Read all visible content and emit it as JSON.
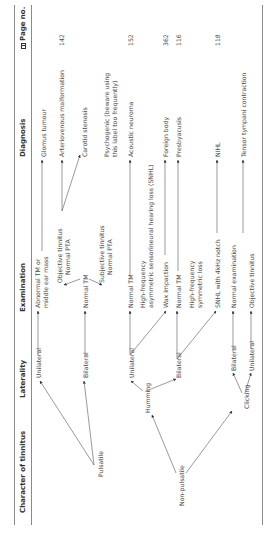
{
  "headers": {
    "character": "Character of tinnitus",
    "laterality": "Laterality",
    "examination": "Examination",
    "diagnosis": "Diagnosis",
    "page_no": "Page no.",
    "page_icon": "book-icon"
  },
  "character": {
    "pulsatile": "Pulsatile",
    "non_pulsatile": "Non-pulsatile",
    "humming": "Humming",
    "clicking": "Clicking"
  },
  "laterality": {
    "pulsatile_unilateral": "Unilateral",
    "pulsatile_bilateral": "Bilateral",
    "humming_unilateral": "Unilateral",
    "humming_bilateral": "Bilateral",
    "clicking_bilateral": "Bilateral",
    "clicking_unilateral": "Unilateral"
  },
  "examination": {
    "abnormal_tm_1": "Abnormal TM or",
    "abnormal_tm_2": "middle ear mass",
    "normal_tm_1": "Normal TM",
    "objective_1": "Objective tinnitus",
    "objective_2": "Normal PTA",
    "subjective_1": "Subjective tinnitus",
    "subjective_2": "Normal PTA",
    "normal_tm_2": "Normal TM",
    "hf_asym_1": "High-frequency",
    "hf_asym_2": "asymmetric sensorineural hearing loss (SNHL)",
    "wax": "Wax impaction",
    "normal_tm_3": "Normal TM",
    "hf_sym_1": "High-frequency",
    "hf_sym_2": "symmetric loss",
    "snhl_notch": "SNHL with 4kHz notch",
    "normal_exam": "Normal examination",
    "objective_tinnitus": "Objective tinnitus"
  },
  "diagnosis": {
    "glomus": "Glomus tumour",
    "avm": "Arteriovenous malformation",
    "carotid": "Carotid stenosis",
    "psychogenic_1": "Psychogenic (beware using",
    "psychogenic_2": "this label too frequently)",
    "acoustic": "Acoustic neuroma",
    "foreign_body": "Foreign body",
    "presbyacusis": "Presbyacusis",
    "nihl": "NIHL",
    "tensor": "Tensor tympani contraction"
  },
  "pages": {
    "avm": "142",
    "acoustic": "152",
    "foreign_body": "362",
    "presbyacusis": "116",
    "nihl": "118"
  }
}
